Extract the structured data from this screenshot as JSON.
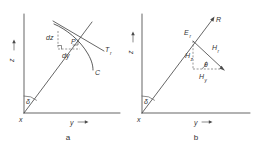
{
  "figure": {
    "panels": [
      {
        "id": "a",
        "caption": "a",
        "axes": {
          "vertical_label": "z",
          "horizontal_label": "y",
          "origin_label": "x"
        },
        "angle_label": "δ",
        "point_label": "P",
        "curve_label": "C",
        "tangent_label": "T",
        "tangent_sub": "r",
        "differential_z": "dz",
        "differential_y": "dy"
      },
      {
        "id": "b",
        "caption": "b",
        "axes": {
          "vertical_label": "z",
          "horizontal_label": "y",
          "origin_label": "x"
        },
        "angle_label": "δ",
        "ray_label": "R",
        "point_label": "E",
        "point_sub": "r",
        "component_z": "H",
        "component_z_sub": "z",
        "component_y": "H",
        "component_y_sub": "y",
        "resultant": "H",
        "resultant_sub": "r",
        "resultant_angle": "θ"
      }
    ],
    "colors": {
      "line": "#4a4a4a",
      "text": "#333333",
      "background": "#ffffff"
    }
  }
}
